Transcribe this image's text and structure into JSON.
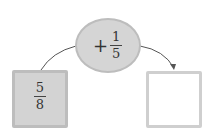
{
  "diagram": {
    "start": {
      "numerator": "5",
      "denominator": "8"
    },
    "operation": {
      "sign": "+",
      "numerator": "1",
      "denominator": "5"
    },
    "result": {
      "value": ""
    }
  },
  "colors": {
    "box_fill": "#d3d3d3",
    "ellipse_fill": "#d5d5d5",
    "border": "#bdbdbd",
    "arrow": "#555555"
  }
}
